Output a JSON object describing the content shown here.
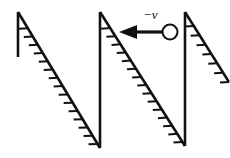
{
  "figure": {
    "background_color": "#ffffff",
    "line_color": "#111111",
    "width": 230,
    "height": 158
  },
  "labels": {
    "velocity": "−v",
    "velocity_x": 143,
    "velocity_y": 8
  },
  "chart_data": {
    "type": "diagram",
    "xlabel": "",
    "ylabel": "",
    "annotations": [
      {
        "text": "−v",
        "x": 150,
        "y": 14,
        "meaning": "negative velocity vector label"
      }
    ],
    "teeth": [
      {
        "name": "tooth-1",
        "vertical": {
          "x1": 18,
          "y1": 12,
          "x2": 18,
          "y2": 57
        },
        "diagonal": {
          "x1": 18,
          "y1": 12,
          "x2": 100,
          "y2": 148
        },
        "hatch_count": 15,
        "hatch_len": 9,
        "hatch_start": 0.12,
        "hatch_end": 0.97
      },
      {
        "name": "tooth-2",
        "vertical": {
          "x1": 100,
          "y1": 12,
          "x2": 100,
          "y2": 148
        },
        "diagonal": {
          "x1": 100,
          "y1": 12,
          "x2": 185,
          "y2": 146
        },
        "hatch_count": 15,
        "hatch_len": 9,
        "hatch_start": 0.12,
        "hatch_end": 0.97
      },
      {
        "name": "tooth-3",
        "vertical": {
          "x1": 185,
          "y1": 12,
          "x2": 185,
          "y2": 146
        },
        "diagonal": {
          "x1": 185,
          "y1": 12,
          "x2": 229,
          "y2": 82
        },
        "hatch_count": 7,
        "hatch_len": 9,
        "hatch_start": 0.2,
        "hatch_end": 1.0
      }
    ],
    "vector": {
      "name": "velocity-vector",
      "label": "−v",
      "direction": "left",
      "shaft_from_x": 163,
      "shaft_to_x": 135,
      "y": 32,
      "head_tip_x": 119,
      "head_back_x": 137,
      "head_half_height": 7
    },
    "body": {
      "name": "body-circle",
      "cx": 170,
      "cy": 32,
      "r": 7.5
    },
    "strokes": {
      "main_width": 2.6,
      "hatch_width": 2.0,
      "shaft_width": 3.2,
      "circle_width": 2.0
    }
  }
}
